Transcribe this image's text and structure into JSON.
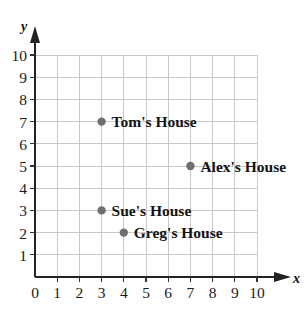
{
  "figure": {
    "background_color": "#ffffff",
    "grid_color": "#c9c9cb",
    "axis_color": "#222222",
    "point_color": "#6e6e73",
    "label_color": "#141414"
  },
  "axes": {
    "x_name": "x",
    "y_name": "y",
    "x_ticks": [
      "0",
      "1",
      "2",
      "3",
      "4",
      "5",
      "6",
      "7",
      "8",
      "9",
      "10"
    ],
    "y_ticks": [
      "1",
      "2",
      "3",
      "4",
      "5",
      "6",
      "7",
      "8",
      "9",
      "10"
    ],
    "origin_label": "0"
  },
  "chart_data": {
    "type": "scatter",
    "title": "",
    "xlabel": "x",
    "ylabel": "y",
    "xlim": [
      0,
      10
    ],
    "ylim": [
      0,
      10
    ],
    "xticks": [
      0,
      1,
      2,
      3,
      4,
      5,
      6,
      7,
      8,
      9,
      10
    ],
    "yticks": [
      0,
      1,
      2,
      3,
      4,
      5,
      6,
      7,
      8,
      9,
      10
    ],
    "grid": true,
    "legend": "none",
    "points": [
      {
        "label": "Tom's House",
        "x": 3,
        "y": 7
      },
      {
        "label": "Alex's House",
        "x": 7,
        "y": 5
      },
      {
        "label": "Sue's House",
        "x": 3,
        "y": 3
      },
      {
        "label": "Greg's House",
        "x": 4,
        "y": 2
      }
    ]
  }
}
